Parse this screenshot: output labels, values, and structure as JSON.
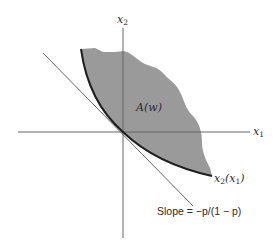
{
  "figure": {
    "axes": {
      "x_axis_label": "x",
      "x_axis_sub": "1",
      "y_axis_label": "x",
      "y_axis_sub": "2"
    },
    "region_label": "A(w)",
    "curve_label": {
      "main": "x",
      "sub": "2",
      "arg_open": "(x",
      "arg_sub": "1",
      "arg_close": ")"
    },
    "tangent_label": "Slope = −p/(1 − p)",
    "colors": {
      "region_fill": "#9a9a9a",
      "axis": "#666666",
      "curve": "#1e1e1e",
      "tangent": "#555555",
      "text": "#2a2a2a"
    }
  }
}
